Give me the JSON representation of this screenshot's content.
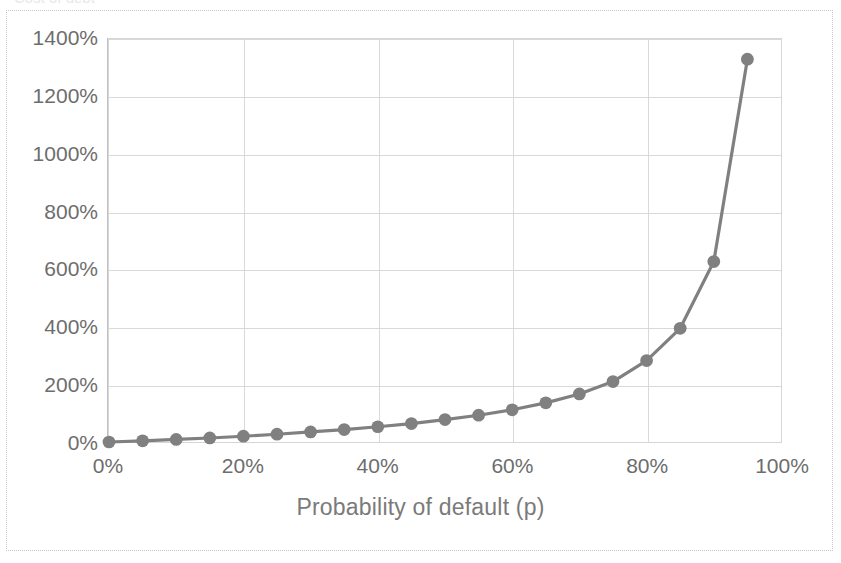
{
  "chart": {
    "title_clipped": "Cost of debt",
    "plot_background": "#ffffff",
    "series_color": "#808080",
    "gridline_color": "#d9d9d9",
    "axis_color": "#c0c0c0",
    "tick_label_color": "#6d6d6d",
    "axis_title_color": "#7a7a7a"
  },
  "chart_data": {
    "type": "line",
    "title": "",
    "xlabel": "Probability of default (p)",
    "ylabel": "",
    "xlim": [
      0,
      100
    ],
    "ylim": [
      0,
      1400
    ],
    "grid": true,
    "legend": "none",
    "marker": "circle",
    "x_tick_labels": [
      "0%",
      "20%",
      "40%",
      "60%",
      "80%",
      "100%"
    ],
    "x_ticks": [
      0,
      20,
      40,
      60,
      80,
      100
    ],
    "y_tick_labels": [
      "0%",
      "200%",
      "400%",
      "600%",
      "800%",
      "1000%",
      "1200%",
      "1400%"
    ],
    "y_ticks": [
      0,
      200,
      400,
      600,
      800,
      1000,
      1200,
      1400
    ],
    "x": [
      0,
      5,
      10,
      15,
      20,
      25,
      30,
      35,
      40,
      45,
      50,
      55,
      60,
      65,
      70,
      75,
      80,
      85,
      90,
      95
    ],
    "values": [
      0,
      4,
      9,
      14,
      20,
      27,
      35,
      43,
      53,
      64,
      78,
      93,
      112,
      136,
      167,
      210,
      283,
      395,
      627,
      1330
    ],
    "series": [
      {
        "name": "Cost of debt",
        "values": [
          0,
          4,
          9,
          14,
          20,
          27,
          35,
          43,
          53,
          64,
          78,
          93,
          112,
          136,
          167,
          210,
          283,
          395,
          627,
          1330
        ]
      }
    ]
  }
}
